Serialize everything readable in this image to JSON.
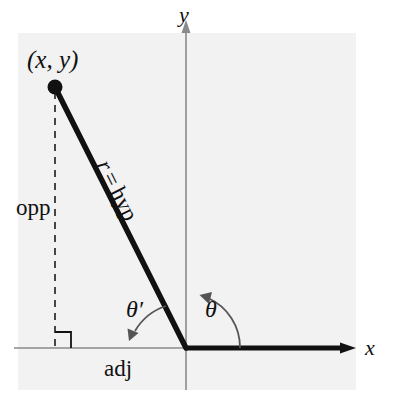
{
  "figure": {
    "type": "geometry-diagram",
    "topic": "Reference angle and right triangle in standard position",
    "background_panel_color": "#f2f2f2",
    "ink_color": "#111111",
    "axis_color": "#8a8a8a"
  },
  "axes": {
    "x_label": "x",
    "y_label": "y",
    "origin": {
      "x": 186,
      "y": 348
    },
    "x_axis_y": 348,
    "y_axis_x": 186,
    "x_arrow_tip": {
      "x": 352,
      "y": 348
    },
    "y_arrow_tip": {
      "x": 186,
      "y": 22
    }
  },
  "point": {
    "label": "(x, y)",
    "label_x": "x",
    "label_y": "y",
    "dot": {
      "x": 55,
      "y": 87
    },
    "dot_radius": 7
  },
  "segments": {
    "hypotenuse_label": "r = hyp",
    "hypotenuse_r": "r",
    "hypotenuse_eq": "=",
    "hypotenuse_hyp": "hyp",
    "opposite_label": "opp",
    "adjacent_label": "adj"
  },
  "angles": {
    "theta": "θ",
    "theta_prime": "θ′",
    "theta_value_note": "standard position angle measured from positive x-axis",
    "theta_prime_value_note": "reference angle measured to negative x-axis"
  },
  "markers": {
    "right_angle": "right-angle-square"
  }
}
